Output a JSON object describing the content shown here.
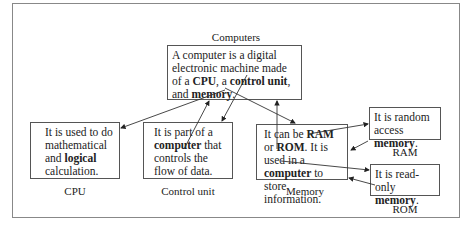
{
  "title": "Computers",
  "root": {
    "label": "Computers",
    "text_parts": [
      "A computer is a digital electronic machine made of a ",
      "CPU",
      ", a ",
      "control unit",
      ", and ",
      "memory",
      "."
    ]
  },
  "nodes": [
    {
      "id": "cpu",
      "label": "CPU",
      "text_parts": [
        "It is used to do mathematical and ",
        "logical",
        " calculation."
      ]
    },
    {
      "id": "control_unit",
      "label": "Control unit",
      "text_parts": [
        "It is part of a ",
        "computer",
        " that controls the flow of data."
      ]
    },
    {
      "id": "memory",
      "label": "Memory",
      "text_parts": [
        "It can be ",
        "RAM",
        " or ",
        "ROM",
        ". It is used in a ",
        "computer",
        " to store information."
      ]
    },
    {
      "id": "ram",
      "label": "RAM",
      "text_parts": [
        "It is random access ",
        "memory",
        "."
      ]
    },
    {
      "id": "rom",
      "label": "ROM",
      "text_parts": [
        "It is read-only ",
        "memory",
        "."
      ]
    }
  ],
  "edges": [
    {
      "from": "root.CPU",
      "to": "cpu"
    },
    {
      "from": "root.control",
      "to": "control_unit"
    },
    {
      "from": "root.memory",
      "to": "memory"
    },
    {
      "from": "control_unit.computer",
      "to": "root"
    },
    {
      "from": "memory.computer",
      "to": "root"
    },
    {
      "from": "memory.RAM",
      "to": "ram"
    },
    {
      "from": "memory.ROM",
      "to": "rom"
    },
    {
      "from": "ram.memory",
      "to": "memory"
    },
    {
      "from": "rom.memory",
      "to": "memory"
    }
  ]
}
